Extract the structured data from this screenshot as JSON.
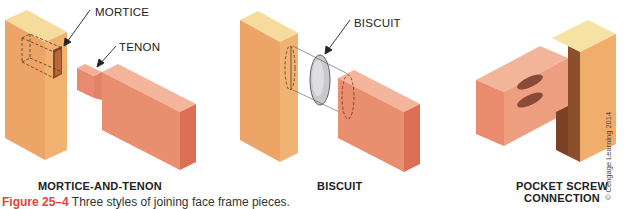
{
  "figure": {
    "panels": [
      {
        "id": "mortice-and-tenon",
        "title": "MORTICE-AND-TENON",
        "callouts": [
          "MORTICE",
          "TENON"
        ]
      },
      {
        "id": "biscuit",
        "title": "BISCUIT",
        "callouts": [
          "BISCUIT"
        ]
      },
      {
        "id": "pocket-screw",
        "title_line1": "POCKET SCREW",
        "title_line2": "CONNECTION",
        "callouts": []
      }
    ],
    "caption": {
      "number": "Figure 25–4",
      "text": " Three styles of joining face frame pieces."
    },
    "credit": "© Cengage Learning 2014",
    "colors": {
      "stile_face": "#eea468",
      "stile_side": "#f2b677",
      "stile_top": "#f7e0a0",
      "rail_face": "#ea8f72",
      "rail_side": "#d9705a",
      "rail_top": "#f3b39a",
      "biscuit": "#c9c9cc",
      "pocket": "#8a4a38",
      "caption_accent": "#e8423a"
    }
  }
}
